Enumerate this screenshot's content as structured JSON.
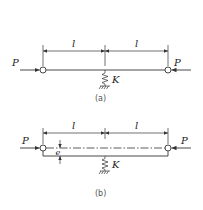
{
  "figure_a": {
    "caption": "(a)",
    "force_left_label": "P",
    "force_right_label": "P",
    "span_left_label": "l",
    "span_right_label": "l",
    "spring_label": "K"
  },
  "figure_b": {
    "caption": "(b)",
    "force_left_label": "P",
    "force_right_label": "P",
    "span_left_label": "l",
    "span_right_label": "l",
    "spring_label": "K",
    "eccentricity_label": "e"
  },
  "colors": {
    "line": "#333333",
    "text": "#222222",
    "background": "#ffffff"
  }
}
